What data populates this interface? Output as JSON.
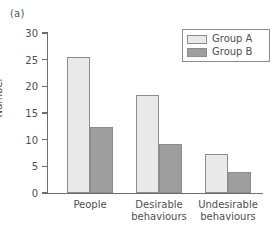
{
  "panel": {
    "label": "(a)"
  },
  "chart_data": {
    "type": "bar",
    "title": "",
    "xlabel": "",
    "ylabel": "Number",
    "ylim": [
      0,
      30
    ],
    "yticks": [
      0,
      5,
      10,
      15,
      20,
      25,
      30
    ],
    "grid": false,
    "legend_position": "top-right",
    "categories": [
      "People",
      "Desirable\nbehaviours",
      "Undesirable\nbehaviours"
    ],
    "series": [
      {
        "name": "Group A",
        "color": "#e9e9e9",
        "values": [
          25.5,
          18.4,
          7.4
        ]
      },
      {
        "name": "Group B",
        "color": "#9e9e9e",
        "values": [
          12.4,
          9.1,
          4.0
        ]
      }
    ]
  },
  "legend": {
    "entries": [
      {
        "label": "Group A"
      },
      {
        "label": "Group B"
      }
    ]
  }
}
